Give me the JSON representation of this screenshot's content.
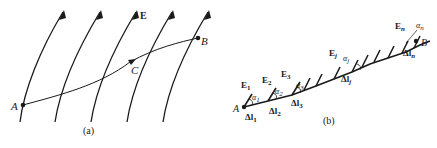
{
  "panel_a": {
    "caption": "(a)",
    "field_label": "E",
    "points": {
      "A": "A",
      "B": "B",
      "C": "C"
    }
  },
  "panel_b": {
    "caption": "(b)",
    "point_A": "A",
    "point_B": "B",
    "field_labels": [
      "E",
      "E",
      "E",
      "E",
      "E"
    ],
    "field_subs": [
      "1",
      "2",
      "3",
      "j",
      "n"
    ],
    "angle_labels": [
      "α",
      "α",
      "α",
      "α",
      "α"
    ],
    "angle_subs": [
      "1",
      "2",
      "3",
      "j",
      "n"
    ],
    "segment_labels": [
      "Δl",
      "Δl",
      "Δl",
      "Δl",
      "Δl"
    ],
    "segment_subs": [
      "1",
      "2",
      "3",
      "j",
      "n"
    ]
  },
  "colors": {
    "ink": "#1a1a1a",
    "background": "#ffffff"
  }
}
